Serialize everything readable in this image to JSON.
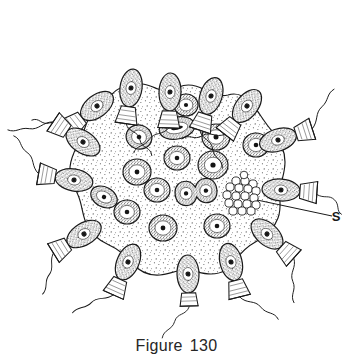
{
  "figure": {
    "caption_label": "Figure",
    "caption_number": "130",
    "caption_full": "Figure 130",
    "style": "stippled pen-and-ink line drawing",
    "background_color": "#ffffff",
    "ink_color": "#1a1a1a",
    "stipple_color": "#3a3a3a",
    "matrix_fill": "#fdfdfd"
  },
  "annotations": [
    {
      "id": "label-s",
      "text": "S",
      "points_to": "spore-cluster",
      "leader_line": true,
      "x": 336,
      "y": 216
    }
  ],
  "structures": {
    "matrix": {
      "name": "gelatinous-matrix",
      "description": "lobed stippled colony matrix",
      "outline_color": "#1a1a1a"
    },
    "spore_cluster": {
      "name": "spore-cluster",
      "label": "S",
      "cell_count": 19,
      "cx": 242,
      "cy": 196,
      "r": 19
    }
  },
  "collar_cells": [
    {
      "id": 1,
      "cx": 97,
      "cy": 106,
      "rot": -38,
      "collar_rot": -38,
      "flagellum": "long-wavy"
    },
    {
      "id": 2,
      "cx": 131,
      "cy": 88,
      "rot": -8,
      "collar_rot": -6,
      "flagellum": "long-wavy"
    },
    {
      "id": 3,
      "cx": 170,
      "cy": 92,
      "rot": 2,
      "collar_rot": 4,
      "flagellum": "long-wavy"
    },
    {
      "id": 4,
      "cx": 211,
      "cy": 96,
      "rot": 12,
      "collar_rot": 16,
      "flagellum": "long-wavy"
    },
    {
      "id": 5,
      "cx": 247,
      "cy": 106,
      "rot": 26,
      "collar_rot": 30,
      "flagellum": "long-wavy"
    },
    {
      "id": 6,
      "cx": 278,
      "cy": 140,
      "rot": 62,
      "collar_rot": 66,
      "flagellum": "long-wavy"
    },
    {
      "id": 7,
      "cx": 283,
      "cy": 188,
      "rot": 86,
      "collar_rot": 90,
      "flagellum": "short-wavy"
    },
    {
      "id": 8,
      "cx": 268,
      "cy": 232,
      "rot": 118,
      "collar_rot": 122,
      "flagellum": "long-wavy"
    },
    {
      "id": 9,
      "cx": 232,
      "cy": 263,
      "rot": 156,
      "collar_rot": 160,
      "flagellum": "long-wavy"
    },
    {
      "id": 10,
      "cx": 188,
      "cy": 275,
      "rot": 178,
      "collar_rot": 182,
      "flagellum": "long-wavy"
    },
    {
      "id": 11,
      "cx": 128,
      "cy": 262,
      "rot": 206,
      "collar_rot": 210,
      "flagellum": "long-wavy"
    },
    {
      "id": 12,
      "cx": 83,
      "cy": 232,
      "rot": 234,
      "collar_rot": 238,
      "flagellum": "long-wavy"
    },
    {
      "id": 13,
      "cx": 73,
      "cy": 178,
      "rot": 262,
      "collar_rot": 266,
      "flagellum": "long-wavy"
    },
    {
      "id": 14,
      "cx": 82,
      "cy": 143,
      "rot": 286,
      "collar_rot": 290,
      "flagellum": "long-wavy"
    }
  ],
  "interior_cells": [
    {
      "id": 1,
      "cx": 139,
      "cy": 137,
      "rx": 13,
      "ry": 12,
      "rot": 20,
      "type": "round"
    },
    {
      "id": 2,
      "cx": 177,
      "cy": 128,
      "rx": 18,
      "ry": 11,
      "rot": -12,
      "type": "dividing-elongate"
    },
    {
      "id": 3,
      "cx": 216,
      "cy": 137,
      "rx": 14,
      "ry": 13,
      "rot": 0,
      "type": "round"
    },
    {
      "id": 4,
      "cx": 256,
      "cy": 145,
      "rx": 13,
      "ry": 12,
      "rot": 0,
      "type": "round"
    },
    {
      "id": 5,
      "cx": 177,
      "cy": 158,
      "rx": 13,
      "ry": 12,
      "rot": 0,
      "type": "round"
    },
    {
      "id": 6,
      "cx": 213,
      "cy": 165,
      "rx": 15,
      "ry": 14,
      "rot": 0,
      "type": "round"
    },
    {
      "id": 7,
      "cx": 137,
      "cy": 172,
      "rx": 14,
      "ry": 13,
      "rot": 0,
      "type": "round"
    },
    {
      "id": 8,
      "cx": 104,
      "cy": 197,
      "rx": 14,
      "ry": 10,
      "rot": 28,
      "type": "oval"
    },
    {
      "id": 9,
      "cx": 157,
      "cy": 190,
      "rx": 13,
      "ry": 12,
      "rot": 0,
      "type": "round"
    },
    {
      "id": 10,
      "cx": 196,
      "cy": 192,
      "rx": 21,
      "ry": 13,
      "rot": -8,
      "type": "dividing-dumbbell"
    },
    {
      "id": 11,
      "cx": 127,
      "cy": 212,
      "rx": 13,
      "ry": 12,
      "rot": 0,
      "type": "round"
    },
    {
      "id": 12,
      "cx": 163,
      "cy": 228,
      "rx": 14,
      "ry": 13,
      "rot": 0,
      "type": "round"
    },
    {
      "id": 13,
      "cx": 217,
      "cy": 226,
      "rx": 13,
      "ry": 12,
      "rot": 0,
      "type": "round"
    },
    {
      "id": 14,
      "cx": 186,
      "cy": 105,
      "rx": 12,
      "ry": 11,
      "rot": 0,
      "type": "round"
    }
  ]
}
